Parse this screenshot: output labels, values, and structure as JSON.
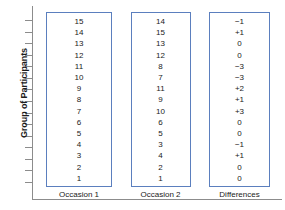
{
  "chart_data": {
    "type": "table",
    "title": "",
    "xlabel": "",
    "ylabel": "Group of Participants",
    "grid": false,
    "legend": "none",
    "axis": {
      "y_tick_count": 15,
      "y_ticks_labeled": false,
      "frame": "left-and-bottom"
    },
    "columns": [
      {
        "label": "Occasion 1",
        "values": [
          "15",
          "14",
          "13",
          "12",
          "11",
          "10",
          "9",
          "8",
          "7",
          "6",
          "5",
          "4",
          "3",
          "2",
          "1"
        ]
      },
      {
        "label": "Occasion 2",
        "values": [
          "14",
          "15",
          "13",
          "12",
          "8",
          "7",
          "11",
          "9",
          "10",
          "6",
          "5",
          "3",
          "4",
          "2",
          "1"
        ]
      },
      {
        "label": "Differences",
        "values": [
          "−1",
          "+1",
          "0",
          "0",
          "−3",
          "−3",
          "+2",
          "+1",
          "+3",
          "0",
          "0",
          "−1",
          "+1",
          "0",
          "0"
        ]
      }
    ],
    "colors": {
      "box_border": "#5b7fbe",
      "axis": "#8c8c8c",
      "text": "#1a1a1a",
      "background": "#ffffff"
    }
  }
}
